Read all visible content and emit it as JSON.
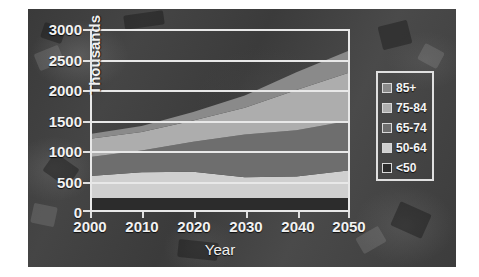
{
  "chart_data": {
    "type": "area",
    "title": "",
    "subtitle": "",
    "xlabel": "Year",
    "ylabel": "Thousands",
    "categories": [
      "2000",
      "2010",
      "2020",
      "2030",
      "2040",
      "2050"
    ],
    "x": [
      2000,
      2010,
      2020,
      2030,
      2040,
      2050
    ],
    "xlim": [
      2000,
      2050
    ],
    "ylim": [
      0,
      3000
    ],
    "yticks": [
      "0",
      "500",
      "1000",
      "1500",
      "2000",
      "2500",
      "3000"
    ],
    "ytick_values": [
      0,
      500,
      1000,
      1500,
      2000,
      2500,
      3000
    ],
    "xticks": [
      "2000",
      "2010",
      "2020",
      "2030",
      "2040",
      "2050"
    ],
    "grid": true,
    "grid_axis": "y",
    "stacked": true,
    "legend_position": "right",
    "series": [
      {
        "name": "<50",
        "values": [
          230,
          230,
          230,
          230,
          230,
          230
        ],
        "color": "#2c2c2c"
      },
      {
        "name": "50-64",
        "values": [
          360,
          420,
          430,
          340,
          350,
          450
        ],
        "color": "#cfcfcf"
      },
      {
        "name": "65-74",
        "values": [
          310,
          360,
          490,
          700,
          760,
          810
        ],
        "color": "#6e6e6e"
      },
      {
        "name": "75-84",
        "values": [
          300,
          300,
          350,
          440,
          660,
          790
        ],
        "color": "#adadad"
      },
      {
        "name": "85+",
        "values": [
          80,
          100,
          140,
          200,
          290,
          360
        ],
        "color": "#8a8a8a"
      }
    ],
    "cumulative_totals": [
      1280,
      1410,
      1640,
      1910,
      2290,
      2640
    ],
    "annotations": []
  },
  "axes": {
    "y_title": "Thousands",
    "x_title": "Year",
    "y_tick_labels": [
      "3000",
      "2500",
      "2000",
      "1500",
      "1000",
      "500",
      "0"
    ],
    "x_tick_labels": [
      "2000",
      "2010",
      "2020",
      "2030",
      "2040",
      "2050"
    ]
  },
  "legend": {
    "items": [
      {
        "label": "85+",
        "color": "#8a8a8a"
      },
      {
        "label": "75-84",
        "color": "#adadad"
      },
      {
        "label": "65-74",
        "color": "#6e6e6e"
      },
      {
        "label": "50-64",
        "color": "#cfcfcf"
      },
      {
        "label": "<50",
        "color": "#2c2c2c"
      }
    ]
  },
  "colors": {
    "grid": "#e8e8e8",
    "text": "#f2f2f2",
    "plate_base": "#3f3f3f",
    "page": "#ffffff"
  }
}
